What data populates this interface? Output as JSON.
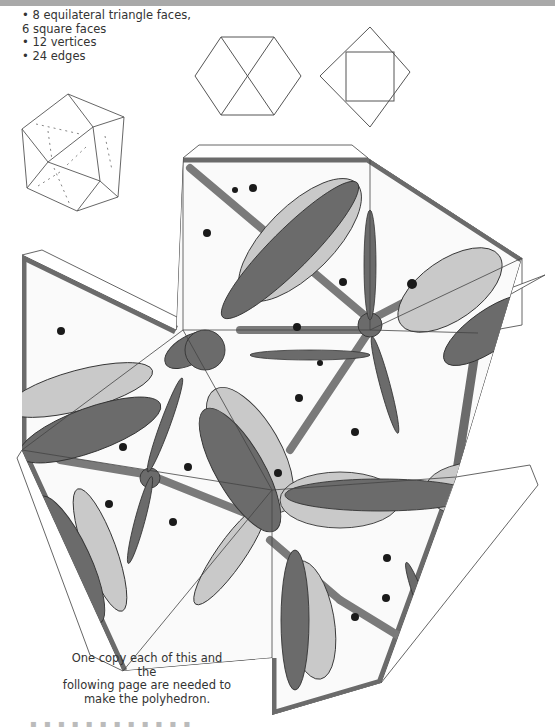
{
  "page": {
    "facts": [
      "• 8 equilateral triangle faces,",
      "6 square faces",
      "• 12 vertices",
      "• 24 edges"
    ],
    "note": [
      "One copy each of this and the",
      "following page are needed to",
      "make the polyhedron."
    ],
    "footer_fragment": "▪ ▪ ▪ ▪ ▪ ▪ ▪ ▪ ▪ ▪ ▪ ▪"
  },
  "diagrams": {
    "hexagon_outline": "hexagon-view",
    "square_outline": "square-view",
    "polyhedron_3d": "cuboctahedron-view"
  },
  "colors": {
    "dark": "#6b6b6b",
    "mid": "#8a8a8a",
    "light": "#c9c9c9",
    "paper": "#fafafa",
    "line": "#333333",
    "dot": "#1a1a1a",
    "topbar": "#a9a9a9"
  }
}
